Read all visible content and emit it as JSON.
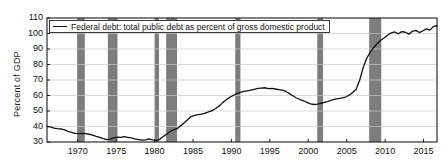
{
  "chart_data": {
    "type": "line",
    "title": "",
    "xlabel": "",
    "ylabel": "Percent of GDP",
    "xlim": [
      1966.0,
      2016.75
    ],
    "ylim": [
      30,
      110
    ],
    "ytick_step": 10,
    "yticks": [
      30,
      40,
      50,
      60,
      70,
      80,
      90,
      100,
      110
    ],
    "xticks": [
      1970,
      1975,
      1980,
      1985,
      1990,
      1995,
      2000,
      2005,
      2010,
      2015
    ],
    "grid": "horizontal",
    "legend_position": "top-left-inside",
    "series": [
      {
        "name": "Federal debt: total public debt as percent of gross domestic product",
        "color": "#111111",
        "x": [
          1966.0,
          1966.5,
          1967.0,
          1967.5,
          1968.0,
          1968.5,
          1969.0,
          1969.5,
          1970.0,
          1970.5,
          1971.0,
          1971.5,
          1972.0,
          1972.5,
          1973.0,
          1973.5,
          1974.0,
          1974.5,
          1975.0,
          1975.5,
          1976.0,
          1976.5,
          1977.0,
          1977.5,
          1978.0,
          1978.5,
          1979.0,
          1979.5,
          1980.0,
          1980.5,
          1981.0,
          1981.5,
          1982.0,
          1982.5,
          1983.0,
          1983.5,
          1984.0,
          1984.5,
          1985.0,
          1985.5,
          1986.0,
          1986.5,
          1987.0,
          1987.5,
          1988.0,
          1988.5,
          1989.0,
          1989.5,
          1990.0,
          1990.5,
          1991.0,
          1991.5,
          1992.0,
          1992.5,
          1993.0,
          1993.5,
          1994.0,
          1994.5,
          1995.0,
          1995.5,
          1996.0,
          1996.5,
          1997.0,
          1997.5,
          1998.0,
          1998.5,
          1999.0,
          1999.5,
          2000.0,
          2000.5,
          2001.0,
          2001.5,
          2002.0,
          2002.5,
          2003.0,
          2003.5,
          2004.0,
          2004.5,
          2005.0,
          2005.5,
          2006.0,
          2006.5,
          2007.0,
          2007.5,
          2008.0,
          2008.5,
          2009.0,
          2009.5,
          2010.0,
          2010.5,
          2011.0,
          2011.5,
          2012.0,
          2012.5,
          2013.0,
          2013.5,
          2014.0,
          2014.5,
          2015.0,
          2015.5,
          2016.0,
          2016.5
        ],
        "y": [
          40.0,
          39.8,
          39.0,
          38.6,
          38.4,
          37.8,
          36.8,
          36.2,
          35.6,
          35.4,
          35.6,
          35.4,
          35.0,
          34.4,
          33.6,
          33.0,
          32.2,
          31.6,
          31.8,
          32.6,
          33.2,
          33.0,
          33.4,
          33.0,
          32.6,
          32.0,
          31.6,
          31.2,
          31.4,
          32.0,
          31.4,
          31.0,
          31.6,
          33.4,
          35.0,
          36.6,
          37.8,
          38.6,
          40.4,
          42.2,
          44.4,
          46.4,
          47.2,
          47.6,
          48.0,
          48.6,
          49.4,
          50.2,
          51.6,
          53.2,
          55.4,
          57.2,
          58.8,
          60.0,
          61.2,
          62.0,
          62.6,
          63.0,
          63.4,
          64.0,
          64.6,
          64.8,
          65.0,
          64.4,
          64.6,
          64.2,
          63.8,
          63.4,
          62.6,
          61.2,
          59.8,
          58.4,
          57.4,
          56.6,
          55.6,
          54.6,
          54.2,
          54.4,
          55.0,
          55.6,
          56.2,
          57.0,
          57.6,
          58.0,
          58.4,
          59.0,
          60.2,
          62.0,
          64.0,
          70.0,
          78.0,
          84.0,
          88.0,
          91.0,
          93.6,
          95.6,
          97.2,
          99.0,
          100.4,
          101.0,
          99.8,
          101.2
        ],
        "y_late": [
          100.8,
          99.6,
          101.4,
          102.0,
          100.6,
          101.8,
          103.0,
          102.2,
          104.6,
          105.0
        ]
      }
    ],
    "recessions": {
      "color": "#7d7d7d",
      "bands": [
        {
          "start": 1969.92,
          "end": 1970.92
        },
        {
          "start": 1973.92,
          "end": 1975.17
        },
        {
          "start": 1980.0,
          "end": 1980.58
        },
        {
          "start": 1981.5,
          "end": 1982.92
        },
        {
          "start": 1990.5,
          "end": 1991.17
        },
        {
          "start": 2001.17,
          "end": 2001.92
        },
        {
          "start": 2007.92,
          "end": 2009.5
        }
      ]
    },
    "legend_entries": [
      {
        "label": "Federal debt: total public debt as percent of gross domestic product",
        "marker": "line",
        "color": "#111111"
      }
    ],
    "axis_color": "#1a1a1a",
    "grid_color": "#c8c8c8",
    "background": "#ffffff"
  },
  "axes": {
    "ylabel": "Percent of GDP",
    "ytick_labels": [
      "30",
      "40",
      "50",
      "60",
      "70",
      "80",
      "90",
      "100",
      "110"
    ],
    "xtick_labels": [
      "1970",
      "1975",
      "1980",
      "1985",
      "1990",
      "1995",
      "2000",
      "2005",
      "2010",
      "2015"
    ]
  },
  "legend": {
    "label": "Federal debt: total public debt as percent of gross domestic product"
  }
}
